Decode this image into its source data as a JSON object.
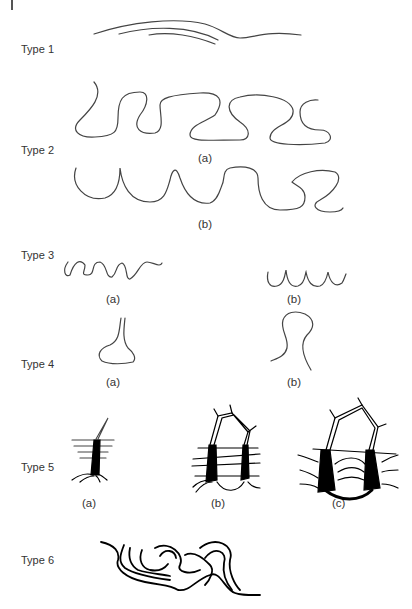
{
  "figure": {
    "rows": [
      {
        "label": "Type 1",
        "captions": []
      },
      {
        "label": "Type 2",
        "captions": [
          "(a)",
          "(b)"
        ]
      },
      {
        "label": "Type 3",
        "captions": [
          "(a)",
          "(b)"
        ]
      },
      {
        "label": "Type 4",
        "captions": [
          "(a)",
          "(b)"
        ]
      },
      {
        "label": "Type 5",
        "captions": [
          "(a)",
          "(b)",
          "(c)"
        ]
      },
      {
        "label": "Type 6",
        "captions": []
      }
    ],
    "colors": {
      "line": "#444444",
      "text": "#333333",
      "fill": "#000000"
    }
  }
}
